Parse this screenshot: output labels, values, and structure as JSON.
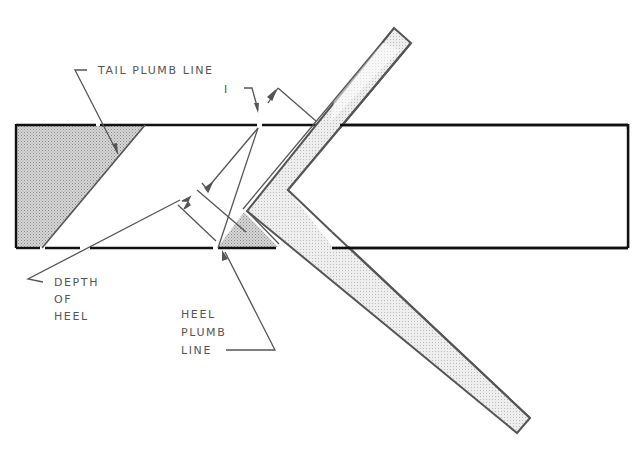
{
  "diagram": {
    "colors": {
      "stroke_dark": "#111111",
      "stroke_gray": "#555555",
      "shade_dark": "#c4c4c4",
      "shade_light": "#e4e4e4",
      "background": "#ffffff"
    },
    "labels": {
      "tail_plumb_line": "TAIL PLUMB LINE",
      "dimension_one": "I",
      "depth_of_heel": [
        "DEPTH",
        "OF",
        "HEEL"
      ],
      "heel_plumb_line": [
        "HEEL",
        "PLUMB",
        "LINE"
      ]
    },
    "elements": {
      "rafter_board": "Horizontal rafter stock drawn as rectangle",
      "tail_cut": "Shaded triangular tail cut at left end",
      "heel_cut": "Shaded small triangle at heel seat",
      "framing_square": "L-shaped framing square laid across the rafter"
    }
  }
}
